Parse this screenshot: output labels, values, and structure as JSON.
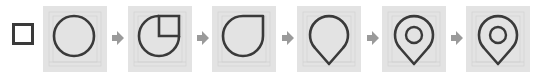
{
  "diagram": {
    "colors": {
      "stroke": "#3a3a3a",
      "panel_bg": "#e3e3e3",
      "grid": "#cfcfcf",
      "arrow": "#9a9a9a"
    },
    "start_shape": "square",
    "steps": [
      {
        "shape": "circle"
      },
      {
        "shape": "circle-with-quarter-square"
      },
      {
        "shape": "teardrop"
      },
      {
        "shape": "pin"
      },
      {
        "shape": "pin-with-inner-circle"
      },
      {
        "shape": "pin-with-inner-circle-final"
      }
    ],
    "connector": "arrow-right"
  }
}
